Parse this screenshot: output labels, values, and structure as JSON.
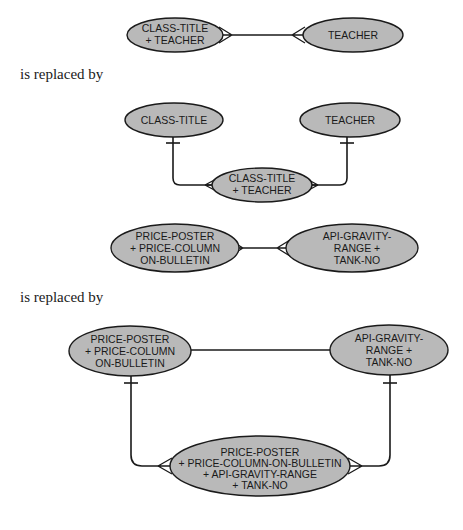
{
  "captions": {
    "first": "is replaced by",
    "second": "is replaced by"
  },
  "example1": {
    "before": {
      "left_entity": [
        "CLASS-TITLE",
        "+ TEACHER"
      ],
      "right_entity": [
        "TEACHER"
      ],
      "relationship": "many-to-many"
    },
    "after": {
      "left_entity": [
        "CLASS-TITLE"
      ],
      "right_entity": [
        "TEACHER"
      ],
      "intersection_entity": [
        "CLASS-TITLE",
        "+ TEACHER"
      ],
      "relationships": [
        "one-to-many",
        "one-to-many"
      ]
    }
  },
  "example2": {
    "before": {
      "left_entity": [
        "PRICE-POSTER",
        "+ PRICE-COLUMN",
        "ON-BULLETIN"
      ],
      "right_entity": [
        "API-GRAVITY-",
        "RANGE +",
        "TANK-NO"
      ],
      "relationship": "many-to-many"
    },
    "after": {
      "left_entity": [
        "PRICE-POSTER",
        "+ PRICE-COLUMN",
        "ON-BULLETIN"
      ],
      "right_entity": [
        "API-GRAVITY-",
        "RANGE +",
        "TANK-NO"
      ],
      "intersection_entity": [
        "PRICE-POSTER",
        "+ PRICE-COLUMN-ON-BULLETIN",
        "+ API-GRAVITY-RANGE",
        "+ TANK-NO"
      ],
      "relationships": [
        "one-to-one",
        "one-to-many",
        "one-to-many"
      ]
    }
  },
  "colors": {
    "entity_fill": "#b9b9b9",
    "stroke": "#1a1a1a",
    "background": "#ffffff"
  }
}
